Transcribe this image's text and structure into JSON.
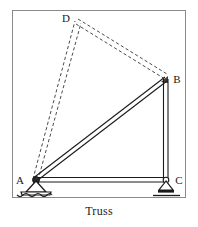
{
  "figure": {
    "caption": "Truss",
    "border_color": "#8a8a8a",
    "member_color": "#1a1a1a",
    "dashed_color": "#4a4a4a",
    "frame": {
      "x": 12,
      "y": 10,
      "width": 174,
      "height": 188
    },
    "joints": [
      {
        "id": "A",
        "label": "A",
        "x": 34,
        "y": 180,
        "label_x": 20,
        "label_y": 184,
        "support": "pin"
      },
      {
        "id": "B",
        "label": "B",
        "x": 165,
        "y": 79,
        "label_x": 174,
        "label_y": 83,
        "support": "none"
      },
      {
        "id": "C",
        "label": "C",
        "x": 167,
        "y": 180,
        "label_x": 175,
        "label_y": 184,
        "support": "roller"
      },
      {
        "id": "D",
        "label": "D",
        "x": 78,
        "y": 22,
        "label_x": 64,
        "label_y": 22,
        "support": "none"
      }
    ],
    "members": [
      {
        "id": "AC",
        "from": "A",
        "to": "C",
        "style": "solid",
        "name": "bottom-chord"
      },
      {
        "id": "AB",
        "from": "A",
        "to": "B",
        "style": "solid",
        "name": "diagonal-chord"
      },
      {
        "id": "BC",
        "from": "B",
        "to": "C",
        "style": "solid",
        "name": "vertical-chord"
      },
      {
        "id": "AD",
        "from": "A",
        "to": "D",
        "style": "dashed",
        "name": "displaced-member-ad"
      },
      {
        "id": "DB",
        "from": "D",
        "to": "B",
        "style": "dashed",
        "name": "displaced-member-db"
      }
    ]
  }
}
